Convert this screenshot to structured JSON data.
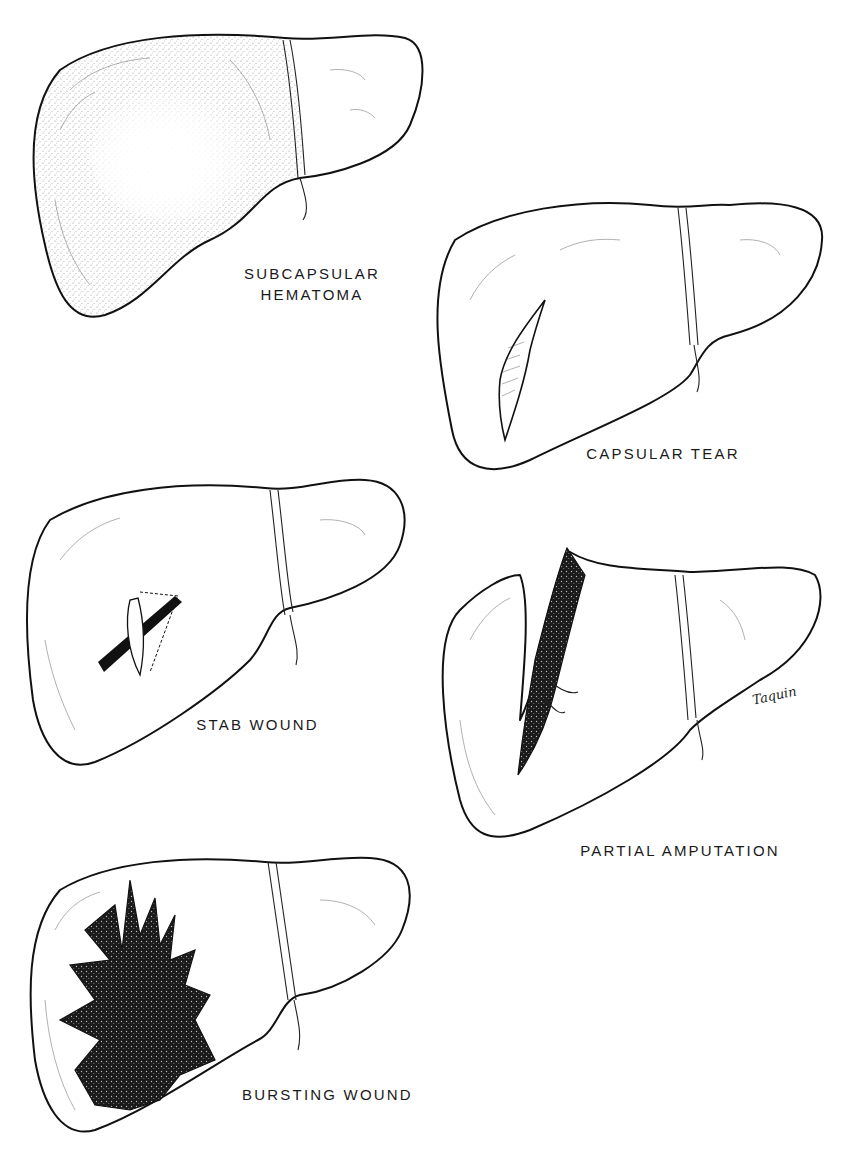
{
  "figure": {
    "panels": [
      {
        "id": "subcapsular-hematoma",
        "label_lines": [
          "SUBCAPSULAR",
          "HEMATOMA"
        ]
      },
      {
        "id": "capsular-tear",
        "label_lines": [
          "CAPSULAR TEAR"
        ]
      },
      {
        "id": "stab-wound",
        "label_lines": [
          "STAB WOUND"
        ]
      },
      {
        "id": "partial-amputation",
        "label_lines": [
          "PARTIAL AMPUTATION"
        ]
      },
      {
        "id": "bursting-wound",
        "label_lines": [
          "BURSTING WOUND"
        ]
      }
    ],
    "signature": "Taquin"
  },
  "colors": {
    "background": "#ffffff",
    "ink": "#111111",
    "wound_fill": "#1a1a1a"
  }
}
